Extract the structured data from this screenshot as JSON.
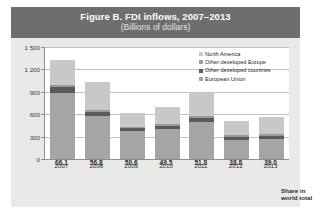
{
  "figure": {
    "title": "Figure B. FDI inflows, 2007–2013",
    "subtitle": "(Billions of dollars)",
    "share_label_line1": "Share in",
    "share_label_line2": "world total"
  },
  "colors": {
    "banner": "#6e6e6e",
    "panel": "#e9e9e7",
    "plot": "#ffffff",
    "north_america": "#c8c8c8",
    "other_developed_europe": "#9a9a9a",
    "other_developed_countries": "#5a5a5a",
    "european_union": "#a5a5a5"
  },
  "chart_data": {
    "type": "bar",
    "title": "Figure B. FDI inflows, 2007–2013",
    "subtitle": "(Billions of dollars)",
    "xlabel": "",
    "ylabel": "Billions of dollars",
    "ylim": [
      0,
      1500
    ],
    "yticks": [
      0,
      300,
      600,
      900,
      1200,
      1500
    ],
    "ytick_labels": [
      "0",
      "300",
      "600",
      "900",
      "1 200",
      "1 500"
    ],
    "grid": true,
    "stacked": true,
    "legend_position": "top-right",
    "categories": [
      "2007",
      "2008",
      "2009",
      "2010",
      "2011",
      "2012",
      "2013"
    ],
    "series": [
      {
        "name": "European Union",
        "values": [
          890,
          580,
          375,
          400,
          495,
          250,
          265
        ]
      },
      {
        "name": "Other developed countries",
        "values": [
          75,
          55,
          35,
          45,
          60,
          50,
          45
        ]
      },
      {
        "name": "Other developed Europe",
        "values": [
          20,
          20,
          20,
          25,
          25,
          20,
          20
        ]
      },
      {
        "name": "North America",
        "values": [
          335,
          375,
          180,
          230,
          300,
          195,
          235
        ]
      }
    ],
    "totals": [
      1320,
      1030,
      610,
      700,
      880,
      515,
      565
    ],
    "share_in_world_total": [
      66.1,
      56.8,
      50.6,
      49.5,
      51.8,
      38.8,
      39.0
    ]
  },
  "legend": {
    "items": [
      {
        "label": "North America",
        "key": "north_america"
      },
      {
        "label": "Other developed Europe",
        "key": "other_developed_europe"
      },
      {
        "label": "Other developed countries",
        "key": "other_developed_countries"
      },
      {
        "label": "European Union",
        "key": "european_union"
      }
    ]
  }
}
